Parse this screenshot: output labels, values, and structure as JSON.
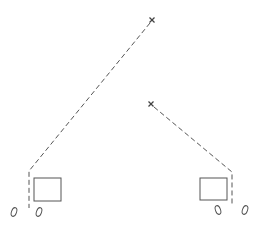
{
  "diagram": {
    "width": 263,
    "height": 232,
    "stroke_color": "#555555",
    "background": "#ffffff",
    "markers": [
      {
        "id": "marker-top",
        "shape": "x",
        "x": 152,
        "y": 20
      },
      {
        "id": "marker-middle",
        "shape": "x",
        "x": 151,
        "y": 104
      }
    ],
    "left_group": {
      "path": [
        [
          150,
          23
        ],
        [
          29,
          171
        ],
        [
          29,
          208
        ]
      ],
      "box": {
        "x": 34,
        "y": 178,
        "w": 27,
        "h": 23
      },
      "ellipses": [
        {
          "cx": 14,
          "cy": 212,
          "rx": 2.5,
          "ry": 4.5,
          "rotate": 20
        },
        {
          "cx": 39,
          "cy": 212,
          "rx": 2.5,
          "ry": 4.5,
          "rotate": 20
        }
      ]
    },
    "right_group": {
      "path": [
        [
          154,
          107
        ],
        [
          232,
          172
        ],
        [
          232,
          206
        ]
      ],
      "box": {
        "x": 200,
        "y": 178,
        "w": 27,
        "h": 22
      },
      "ellipses": [
        {
          "cx": 218,
          "cy": 210,
          "rx": 2.5,
          "ry": 4.5,
          "rotate": -20
        },
        {
          "cx": 245,
          "cy": 210,
          "rx": 2.5,
          "ry": 4.5,
          "rotate": 20
        }
      ]
    }
  }
}
